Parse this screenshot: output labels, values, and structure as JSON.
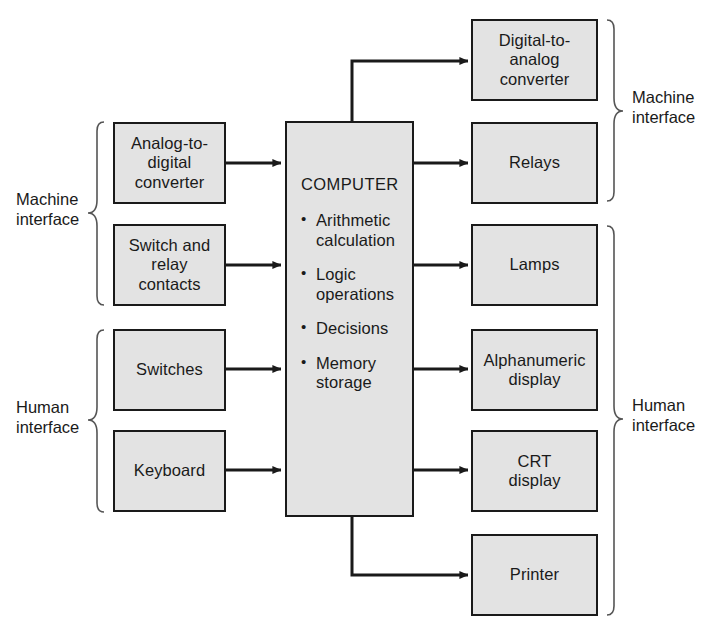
{
  "diagram": {
    "colors": {
      "box_fill": "#e3e3e3",
      "line": "#1a1a1a",
      "background": "#ffffff"
    },
    "center": {
      "title": "COMPUTER",
      "functions": [
        "Arithmetic\ncalculation",
        "Logic\noperations",
        "Decisions",
        "Memory\nstorage"
      ]
    },
    "inputs": [
      {
        "label": "Analog-to-\ndigital\nconverter"
      },
      {
        "label": "Switch and\nrelay\ncontacts"
      },
      {
        "label": "Switches"
      },
      {
        "label": "Keyboard"
      }
    ],
    "outputs": [
      {
        "label": "Digital-to-\nanalog\nconverter"
      },
      {
        "label": "Relays"
      },
      {
        "label": "Lamps"
      },
      {
        "label": "Alphanumeric\ndisplay"
      },
      {
        "label": "CRT\ndisplay"
      },
      {
        "label": "Printer"
      }
    ],
    "group_labels": {
      "left_machine": "Machine\ninterface",
      "left_human": "Human\ninterface",
      "right_machine": "Machine\ninterface",
      "right_human": "Human\ninterface"
    }
  }
}
